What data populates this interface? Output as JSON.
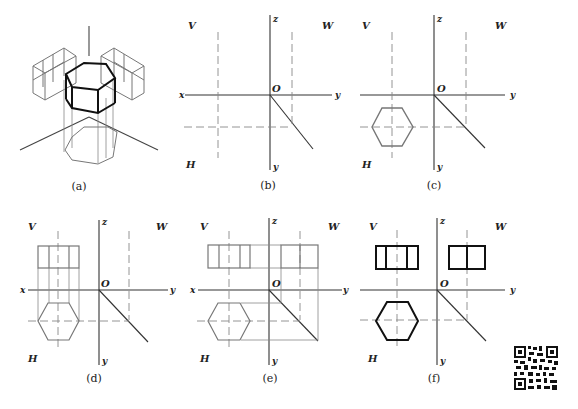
{
  "figure": {
    "panels": [
      {
        "id": "a",
        "caption": "(a)"
      },
      {
        "id": "b",
        "caption": "(b)",
        "labels": {
          "v": "V",
          "w": "W",
          "h": "H",
          "x": "x",
          "y_right": "y",
          "y_down": "y",
          "z": "z",
          "origin": "O"
        }
      },
      {
        "id": "c",
        "caption": "(c)",
        "labels": {
          "v": "V",
          "w": "W",
          "h": "H",
          "x": "x",
          "y_right": "y",
          "y_down": "y",
          "z": "z",
          "origin": "O"
        }
      },
      {
        "id": "d",
        "caption": "(d)",
        "labels": {
          "v": "V",
          "w": "W",
          "h": "H",
          "x": "x",
          "y_right": "y",
          "y_down": "y",
          "z": "z",
          "origin": "O"
        }
      },
      {
        "id": "e",
        "caption": "(e)",
        "labels": {
          "v": "V",
          "w": "W",
          "h": "H",
          "x": "x",
          "y_right": "y",
          "y_down": "y",
          "z": "z",
          "origin": "O"
        }
      },
      {
        "id": "f",
        "caption": "(f)",
        "labels": {
          "v": "V",
          "w": "W",
          "h": "H",
          "x": "x",
          "y_right": "y",
          "y_down": "y",
          "z": "z",
          "origin": "O"
        }
      }
    ],
    "qr_code": {
      "icon": "qr-code-icon"
    }
  }
}
